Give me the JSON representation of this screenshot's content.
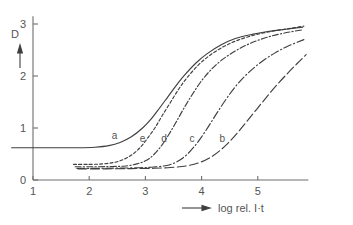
{
  "figure": {
    "title": "",
    "y_axis_title": "D",
    "y_axis_arrow": "up-arrow-icon",
    "x_axis_title": "log rel. I·t",
    "x_axis_arrow": "right-arrow-icon"
  },
  "chart_data": {
    "type": "line",
    "title": "",
    "subtitle": "",
    "xlabel": "log rel. I·t",
    "ylabel": "D",
    "xlim": [
      0.6,
      5.9
    ],
    "ylim": [
      0,
      3.15
    ],
    "xticks": [
      1,
      2,
      3,
      4,
      5
    ],
    "xtick_labels": [
      "1",
      "2",
      "3",
      "4",
      "5"
    ],
    "yticks": [
      0,
      1,
      2,
      3
    ],
    "ytick_labels": [
      "0",
      "1",
      "2",
      "3"
    ],
    "grid": false,
    "legend": "inline-curve-labels",
    "legend_position": "on-curve",
    "series": [
      {
        "name": "a",
        "label": "a",
        "linestyle": "solid",
        "label_x": 2.45,
        "label_y": 0.78,
        "points": [
          [
            0.62,
            0.62
          ],
          [
            1.0,
            0.62
          ],
          [
            1.4,
            0.62
          ],
          [
            1.8,
            0.62
          ],
          [
            2.1,
            0.63
          ],
          [
            2.35,
            0.66
          ],
          [
            2.55,
            0.72
          ],
          [
            2.75,
            0.83
          ],
          [
            2.95,
            1.0
          ],
          [
            3.1,
            1.17
          ],
          [
            3.25,
            1.38
          ],
          [
            3.4,
            1.6
          ],
          [
            3.55,
            1.82
          ],
          [
            3.7,
            2.02
          ],
          [
            3.9,
            2.25
          ],
          [
            4.1,
            2.43
          ],
          [
            4.35,
            2.6
          ],
          [
            4.6,
            2.72
          ],
          [
            4.9,
            2.8
          ],
          [
            5.2,
            2.86
          ],
          [
            5.5,
            2.9
          ],
          [
            5.8,
            2.94
          ]
        ]
      },
      {
        "name": "e",
        "label": "e",
        "linestyle": "short-dash",
        "label_x": 2.95,
        "label_y": 0.73,
        "points": [
          [
            1.72,
            0.3
          ],
          [
            2.0,
            0.3
          ],
          [
            2.25,
            0.31
          ],
          [
            2.45,
            0.34
          ],
          [
            2.62,
            0.4
          ],
          [
            2.78,
            0.5
          ],
          [
            2.92,
            0.64
          ],
          [
            3.05,
            0.82
          ],
          [
            3.18,
            1.02
          ],
          [
            3.3,
            1.24
          ],
          [
            3.45,
            1.5
          ],
          [
            3.6,
            1.76
          ],
          [
            3.75,
            1.98
          ],
          [
            3.95,
            2.22
          ],
          [
            4.15,
            2.4
          ],
          [
            4.4,
            2.57
          ],
          [
            4.65,
            2.69
          ],
          [
            4.95,
            2.79
          ],
          [
            5.25,
            2.86
          ],
          [
            5.55,
            2.91
          ],
          [
            5.82,
            2.96
          ]
        ]
      },
      {
        "name": "d",
        "label": "d",
        "linestyle": "dash-dot",
        "label_x": 3.33,
        "label_y": 0.74,
        "points": [
          [
            1.75,
            0.255
          ],
          [
            2.1,
            0.255
          ],
          [
            2.4,
            0.26
          ],
          [
            2.65,
            0.27
          ],
          [
            2.85,
            0.31
          ],
          [
            3.02,
            0.38
          ],
          [
            3.16,
            0.5
          ],
          [
            3.3,
            0.68
          ],
          [
            3.42,
            0.88
          ],
          [
            3.55,
            1.12
          ],
          [
            3.68,
            1.37
          ],
          [
            3.82,
            1.62
          ],
          [
            3.98,
            1.88
          ],
          [
            4.15,
            2.1
          ],
          [
            4.35,
            2.3
          ],
          [
            4.6,
            2.48
          ],
          [
            4.85,
            2.62
          ],
          [
            5.15,
            2.74
          ],
          [
            5.45,
            2.82
          ],
          [
            5.8,
            2.89
          ]
        ]
      },
      {
        "name": "c",
        "label": "c",
        "linestyle": "dash-dot-long",
        "label_x": 3.83,
        "label_y": 0.73,
        "points": [
          [
            1.78,
            0.225
          ],
          [
            2.2,
            0.225
          ],
          [
            2.55,
            0.23
          ],
          [
            2.9,
            0.235
          ],
          [
            3.15,
            0.25
          ],
          [
            3.38,
            0.28
          ],
          [
            3.56,
            0.35
          ],
          [
            3.72,
            0.47
          ],
          [
            3.86,
            0.63
          ],
          [
            4.0,
            0.83
          ],
          [
            4.14,
            1.06
          ],
          [
            4.28,
            1.3
          ],
          [
            4.44,
            1.56
          ],
          [
            4.62,
            1.82
          ],
          [
            4.82,
            2.05
          ],
          [
            5.05,
            2.26
          ],
          [
            5.3,
            2.44
          ],
          [
            5.55,
            2.58
          ],
          [
            5.82,
            2.7
          ]
        ]
      },
      {
        "name": "b",
        "label": "b",
        "linestyle": "long-dash",
        "label_x": 4.37,
        "label_y": 0.74,
        "points": [
          [
            1.8,
            0.215
          ],
          [
            2.3,
            0.215
          ],
          [
            2.75,
            0.22
          ],
          [
            3.15,
            0.225
          ],
          [
            3.45,
            0.24
          ],
          [
            3.72,
            0.27
          ],
          [
            3.95,
            0.33
          ],
          [
            4.15,
            0.43
          ],
          [
            4.32,
            0.56
          ],
          [
            4.48,
            0.72
          ],
          [
            4.64,
            0.91
          ],
          [
            4.8,
            1.12
          ],
          [
            4.98,
            1.36
          ],
          [
            5.16,
            1.6
          ],
          [
            5.34,
            1.83
          ],
          [
            5.52,
            2.04
          ],
          [
            5.7,
            2.24
          ],
          [
            5.86,
            2.41
          ]
        ]
      }
    ]
  }
}
